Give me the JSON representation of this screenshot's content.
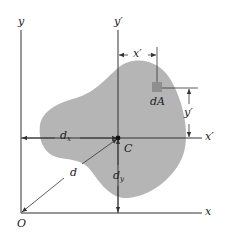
{
  "figure": {
    "type": "centroidal axes / parallel-axis theorem diagram",
    "colors": {
      "area_fill": "#b5b5b5",
      "element_fill": "#8e8e8e",
      "line": "#333333",
      "background": "#ffffff"
    },
    "labels": {
      "y_axis": "y",
      "y_prime_axis": "y′",
      "x_axis": "x",
      "x_prime_axis": "x′",
      "origin": "O",
      "centroid": "C",
      "element": "dA",
      "x_prime_dim": "x′",
      "y_prime_dim": "y′",
      "dx_main": "d",
      "dx_sub": "x",
      "dy_main": "d",
      "dy_sub": "y",
      "d": "d"
    }
  }
}
